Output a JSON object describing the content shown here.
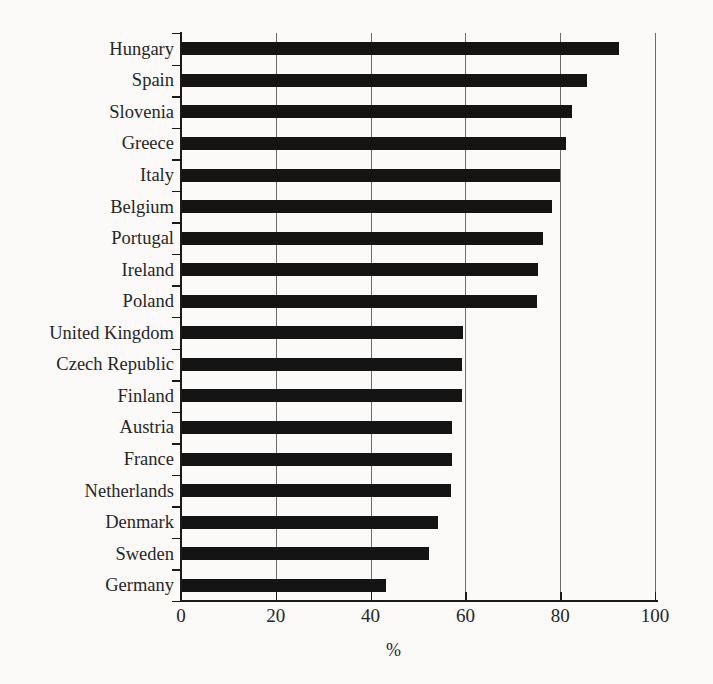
{
  "chart_data": {
    "type": "bar",
    "orientation": "horizontal",
    "title": "",
    "subtitle": "",
    "xlabel": "%",
    "ylabel": "",
    "xlim": [
      0,
      105
    ],
    "xticks": [
      "0",
      "20",
      "40",
      "60",
      "80",
      "100"
    ],
    "xtick_values": [
      0,
      20,
      40,
      60,
      80,
      100
    ],
    "grid": "vertical gridlines at each x tick",
    "legend": "none",
    "bar_color": "#141414",
    "background_color": "#fbfaf8",
    "gridline_color": "#6e6e6e",
    "axis_color": "#1a1a1a",
    "categories": [
      "Hungary",
      "Spain",
      "Slovenia",
      "Greece",
      "Italy",
      "Belgium",
      "Portugal",
      "Ireland",
      "Poland",
      "United Kingdom",
      "Czech Republic",
      "Finland",
      "Austria",
      "France",
      "Netherlands",
      "Denmark",
      "Sweden",
      "Germany"
    ],
    "values": [
      92.4,
      85.6,
      82.4,
      81.3,
      80.0,
      78.3,
      76.3,
      75.4,
      75.2,
      59.4,
      59.3,
      59.3,
      57.2,
      57.1,
      57.0,
      54.2,
      52.3,
      43.3
    ]
  }
}
